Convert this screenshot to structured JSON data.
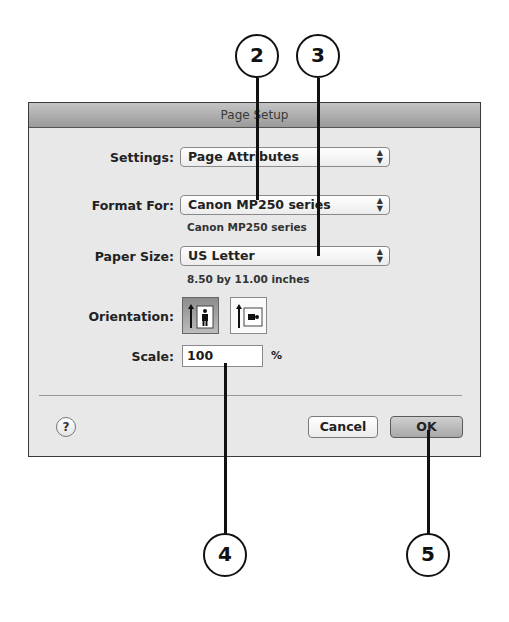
{
  "dialog": {
    "title": "Page Setup",
    "settings": {
      "label": "Settings:",
      "value": "Page Attributes"
    },
    "format_for": {
      "label": "Format For:",
      "value": "Canon MP250 series",
      "detail": "Canon MP250 series"
    },
    "paper_size": {
      "label": "Paper Size:",
      "value": "US Letter",
      "detail": "8.50 by 11.00 inches"
    },
    "orientation": {
      "label": "Orientation:",
      "options": [
        "portrait",
        "landscape"
      ],
      "selected": "portrait"
    },
    "scale": {
      "label": "Scale:",
      "value": "100",
      "unit": "%"
    },
    "help_label": "?",
    "cancel_label": "Cancel",
    "ok_label": "OK",
    "popup_arrows": "▲\n▼"
  },
  "callouts": [
    {
      "number": "2",
      "target": "format-for-popup"
    },
    {
      "number": "3",
      "target": "paper-size-popup"
    },
    {
      "number": "4",
      "target": "scale-field"
    },
    {
      "number": "5",
      "target": "ok-button"
    }
  ]
}
